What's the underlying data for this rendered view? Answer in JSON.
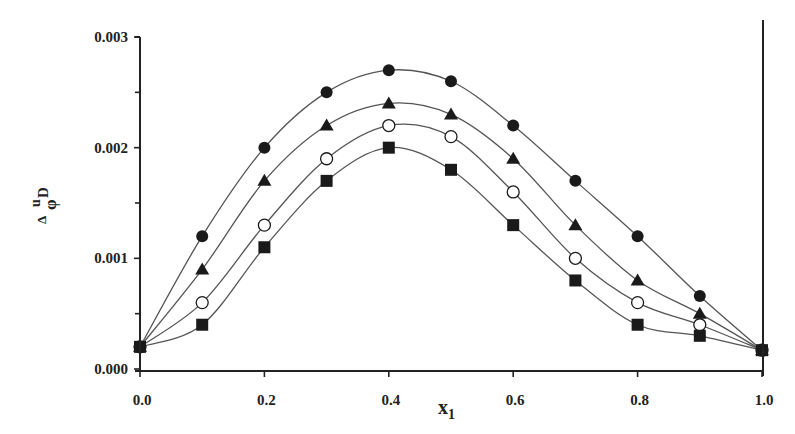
{
  "chart_data": {
    "type": "scatter",
    "title": "",
    "xlabel": "x",
    "xlabel_sub": "1",
    "ylabel_parts": {
      "delta": "Δ",
      "phi": "φ",
      "sup": "u",
      "sub": "D"
    },
    "xlim": [
      0.0,
      1.0
    ],
    "ylim": [
      0.0,
      0.003
    ],
    "x_ticks": [
      0.0,
      0.2,
      0.4,
      0.6,
      0.8,
      1.0
    ],
    "x_tick_labels": [
      "0.0",
      "0.2",
      "0.4",
      "0.6",
      "0.8",
      "1.0"
    ],
    "y_ticks": [
      0.0,
      0.001,
      0.002,
      0.003
    ],
    "y_tick_labels": [
      "0.000",
      "0.001",
      "0.002",
      "0.003"
    ],
    "y_minor_ticks": [
      0.0005,
      0.0015,
      0.0025
    ],
    "x_minor_ticks": [
      0.1,
      0.3,
      0.5,
      0.7,
      0.9
    ],
    "grid": false,
    "legend": "none",
    "x": [
      0.0,
      0.1,
      0.2,
      0.3,
      0.4,
      0.5,
      0.6,
      0.7,
      0.8,
      0.9,
      1.0
    ],
    "series": [
      {
        "name": "filled-circle",
        "marker": "circle-filled",
        "values": [
          0.0002,
          0.0012,
          0.002,
          0.0025,
          0.0027,
          0.0026,
          0.0022,
          0.0017,
          0.0012,
          0.00066,
          0.00017
        ]
      },
      {
        "name": "filled-triangle",
        "marker": "triangle-filled",
        "values": [
          0.0002,
          0.0009,
          0.0017,
          0.0022,
          0.0024,
          0.0023,
          0.0019,
          0.0013,
          0.0008,
          0.0005,
          0.00017
        ]
      },
      {
        "name": "open-circle",
        "marker": "circle-open",
        "values": [
          0.0002,
          0.0006,
          0.0013,
          0.0019,
          0.0022,
          0.0021,
          0.0016,
          0.001,
          0.0006,
          0.0004,
          0.00017
        ]
      },
      {
        "name": "filled-square",
        "marker": "square-filled",
        "values": [
          0.0002,
          0.0004,
          0.0011,
          0.0017,
          0.002,
          0.0018,
          0.0013,
          0.0008,
          0.0004,
          0.0003,
          0.00017
        ]
      }
    ]
  }
}
